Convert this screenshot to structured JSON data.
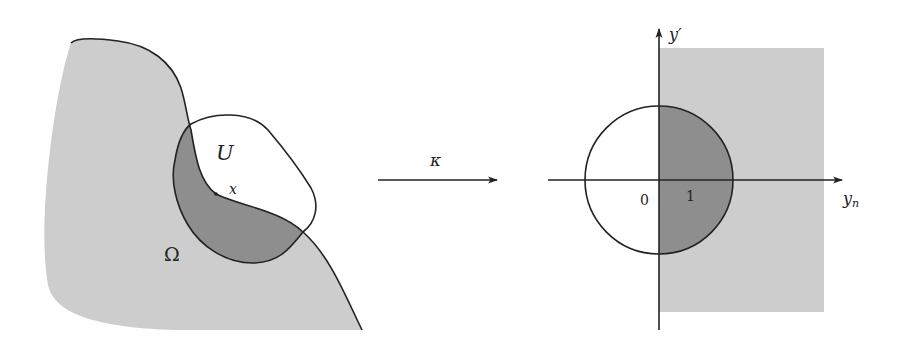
{
  "diagram": {
    "colors": {
      "light_fill": "#cdcdcd",
      "dark_fill": "#8e8e8e",
      "stroke": "#222222",
      "background": "#ffffff"
    },
    "left_panel": {
      "domain_label": "Ω",
      "neighborhood_label": "U",
      "point_label": "x"
    },
    "map": {
      "label": "κ"
    },
    "right_panel": {
      "vertical_axis_label": "y′",
      "horizontal_axis_label_base": "y",
      "horizontal_axis_label_sub": "n",
      "origin_label": "0",
      "unit_label": "1"
    }
  }
}
